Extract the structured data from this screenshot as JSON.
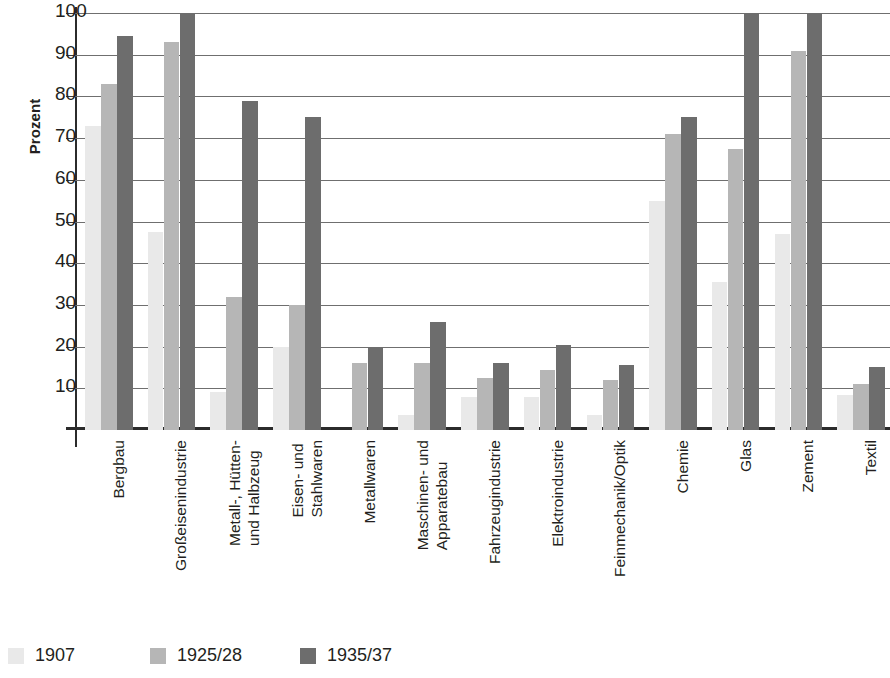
{
  "chart_data": {
    "type": "bar",
    "title": "",
    "xlabel": "",
    "ylabel": "Prozent",
    "ylim": [
      0,
      100
    ],
    "yticks": [
      10,
      20,
      30,
      40,
      50,
      60,
      70,
      80,
      90,
      100
    ],
    "grid": true,
    "legend_position": "bottom-left",
    "categories": [
      "Bergbau",
      "Großeisenindustrie",
      "Metall-, Hütten- und Halbzeug",
      "Eisen- und Stahlwaren",
      "Metallwaren",
      "Maschinen- und Apparatebau",
      "Fahrzeugindustrie",
      "Elektroindustrie",
      "Feinmechanik/Optik",
      "Chemie",
      "Glas",
      "Zement",
      "Textil"
    ],
    "category_lines": [
      [
        "Bergbau"
      ],
      [
        "Großeisenindustrie"
      ],
      [
        "Metall-, Hütten-",
        "und Halbzeug"
      ],
      [
        "Eisen- und",
        "Stahlwaren"
      ],
      [
        "Metallwaren"
      ],
      [
        "Maschinen- und",
        "Apparatebau"
      ],
      [
        "Fahrzeugindustrie"
      ],
      [
        "Elektroindustrie"
      ],
      [
        "Feinmechanik/Optik"
      ],
      [
        "Chemie"
      ],
      [
        "Glas"
      ],
      [
        "Zement"
      ],
      [
        "Textil"
      ]
    ],
    "series": [
      {
        "name": "1907",
        "color": "#e9e9e9",
        "values": [
          73,
          47.5,
          9,
          20,
          null,
          3.5,
          8,
          8,
          3.5,
          55,
          35.5,
          47,
          8.5
        ]
      },
      {
        "name": "1925/28",
        "color": "#b6b6b6",
        "values": [
          83,
          93,
          32,
          30,
          16,
          16,
          12.5,
          14.5,
          12,
          71,
          67.5,
          91,
          11
        ]
      },
      {
        "name": "1935/37",
        "color": "#6d6d6d",
        "values": [
          94.5,
          100,
          79,
          75,
          20,
          26,
          16,
          20.5,
          15.5,
          75,
          100,
          100,
          15
        ]
      }
    ]
  },
  "legend": {
    "items": [
      {
        "label": "1907",
        "color": "#e9e9e9"
      },
      {
        "label": "1925/28",
        "color": "#b6b6b6"
      },
      {
        "label": "1935/37",
        "color": "#6d6d6d"
      }
    ]
  },
  "axis": {
    "y_title": "Prozent",
    "y_tick_labels": [
      "10",
      "20",
      "30",
      "40",
      "50",
      "60",
      "70",
      "80",
      "90",
      "100"
    ]
  }
}
